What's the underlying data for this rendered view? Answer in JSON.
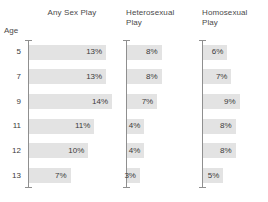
{
  "chart_data": {
    "type": "bar",
    "orientation": "horizontal",
    "title": "",
    "xlabel": "",
    "ylabel": "Age",
    "categories": [
      "5",
      "7",
      "9",
      "11",
      "12",
      "13"
    ],
    "xlim": [
      0,
      16
    ],
    "grid": false,
    "legend": "none",
    "value_suffix": "%",
    "panels": [
      {
        "name": "any-sex-play",
        "title": "Any Sex Play",
        "values": [
          13,
          13,
          14,
          11,
          10,
          7
        ],
        "labels": [
          "13%",
          "13%",
          "14%",
          "11%",
          "10%",
          "7%"
        ]
      },
      {
        "name": "heterosexual-play",
        "title": "Heterosexual\nPlay",
        "values": [
          8,
          8,
          7,
          4,
          4,
          3
        ],
        "labels": [
          "8%",
          "8%",
          "7%",
          "4%",
          "4%",
          "3%"
        ]
      },
      {
        "name": "homosexual-play",
        "title": "Homosexual\nPlay",
        "values": [
          6,
          7,
          9,
          8,
          8,
          5
        ],
        "labels": [
          "6%",
          "7%",
          "9%",
          "8%",
          "8%",
          "5%"
        ]
      }
    ],
    "colors": {
      "bar_fill": "#e3e3e3",
      "axis": "#8f8f8f",
      "text": "#3b3b3b",
      "background": "#ffffff"
    }
  }
}
